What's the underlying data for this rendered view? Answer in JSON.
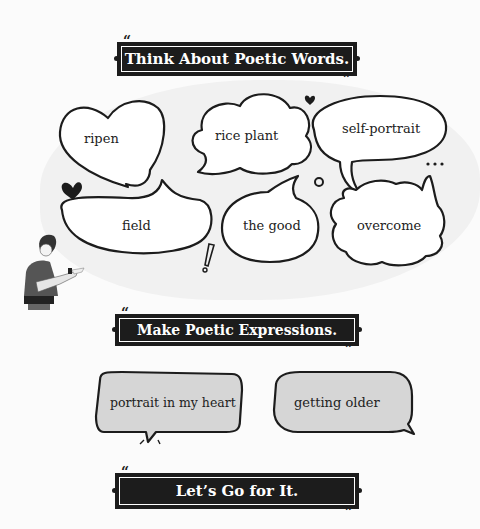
{
  "sections": [
    {
      "title": "Think About Poetic Words."
    },
    {
      "title": "Make Poetic Expressions."
    },
    {
      "title": "Let’s Go for It."
    }
  ],
  "poetic_words": [
    "ripen",
    "rice plant",
    "self-portrait",
    "field",
    "the good",
    "overcome"
  ],
  "poetic_expressions": [
    "portrait in my heart",
    "getting older"
  ],
  "quote_open": "“",
  "quote_close": "”",
  "colors": {
    "banner_bg": "#1c1c1c",
    "bubble_fill_gray": "#d6d6d6",
    "page_bg": "#fbfbfb"
  }
}
